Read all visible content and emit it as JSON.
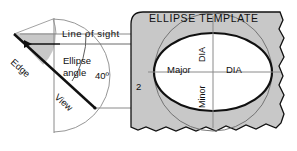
{
  "diagram": {
    "colors": {
      "template_fill": "#c8c8c8",
      "ellipse_fill": "#ffffff",
      "wedge_fill": "#c8c8c8",
      "line": "#1a1a1a",
      "thin_line": "#8a8a8a",
      "faint_label": "#9a9a9a",
      "background": "#ffffff"
    },
    "template": {
      "title_label": "ELLIPSE TEMPLATE",
      "size_label": "2",
      "major_label": "Major",
      "major_dia_label": "DIA",
      "minor_label": "Minor",
      "minor_dia_label": "DIA",
      "right_dia_label": "DIA"
    },
    "construction": {
      "line_of_sight_label": "Line of sight",
      "ellipse_angle_label_line1": "Ellipse",
      "ellipse_angle_label_line2": "angle",
      "angle_value_label": "40º",
      "edge_label": "Edge",
      "view_label": "View"
    }
  }
}
